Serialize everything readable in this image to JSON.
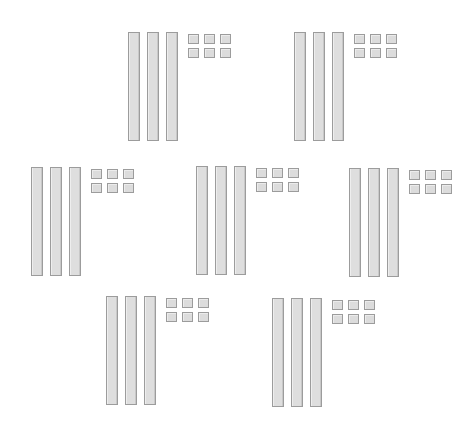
{
  "figure": {
    "colors": {
      "background": "#ffffff",
      "block_fill": "#dedede",
      "block_border": "#9c9c9c"
    },
    "groups": [
      {
        "id": 1,
        "x": 128,
        "y": 32,
        "tens": 3,
        "ones": 6
      },
      {
        "id": 2,
        "x": 294,
        "y": 32,
        "tens": 3,
        "ones": 6
      },
      {
        "id": 3,
        "x": 31,
        "y": 167,
        "tens": 3,
        "ones": 6
      },
      {
        "id": 4,
        "x": 196,
        "y": 166,
        "tens": 3,
        "ones": 6
      },
      {
        "id": 5,
        "x": 349,
        "y": 168,
        "tens": 3,
        "ones": 6
      },
      {
        "id": 6,
        "x": 106,
        "y": 296,
        "tens": 3,
        "ones": 6
      },
      {
        "id": 7,
        "x": 272,
        "y": 298,
        "tens": 3,
        "ones": 6
      }
    ],
    "layout": {
      "rod_spacing": 19,
      "rod_width": 12,
      "rod_height": 109,
      "cube_start_x": 60,
      "cube_spacing_x": 16,
      "cube_spacing_y": 14,
      "cube_start_y": 2
    }
  }
}
